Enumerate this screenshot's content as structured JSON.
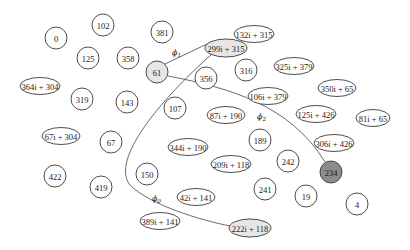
{
  "diagram": {
    "colors": {
      "default_fill": "#ffffff",
      "highlight_fill": "#e6e6e6",
      "active_fill": "#8c8c8c",
      "stroke": "#3a3a3a"
    },
    "nodes": [
      {
        "id": "n0",
        "label": "0",
        "shape": "circle",
        "cx": 56,
        "cy": 38,
        "rx": 11,
        "ry": 11,
        "fill": "default"
      },
      {
        "id": "n102",
        "label": "102",
        "shape": "circle",
        "cx": 103,
        "cy": 25,
        "rx": 11,
        "ry": 11,
        "fill": "default"
      },
      {
        "id": "n381",
        "label": "381",
        "shape": "circle",
        "cx": 162,
        "cy": 32,
        "rx": 11,
        "ry": 11,
        "fill": "default"
      },
      {
        "id": "n132i315",
        "label": "132i + 315",
        "shape": "ellipse",
        "cx": 254,
        "cy": 34,
        "rx": 20,
        "ry": 8.5,
        "fill": "default"
      },
      {
        "id": "n299i315",
        "label": "299i + 315",
        "shape": "ellipse",
        "cx": 226,
        "cy": 48,
        "rx": 21,
        "ry": 9,
        "fill": "highlight"
      },
      {
        "id": "n125",
        "label": "125",
        "shape": "circle",
        "cx": 88,
        "cy": 58,
        "rx": 11,
        "ry": 11,
        "fill": "default"
      },
      {
        "id": "n358",
        "label": "358",
        "shape": "circle",
        "cx": 128,
        "cy": 58,
        "rx": 11,
        "ry": 11,
        "fill": "default"
      },
      {
        "id": "n61",
        "label": "61",
        "shape": "circle",
        "cx": 157,
        "cy": 72,
        "rx": 11,
        "ry": 11,
        "fill": "highlight"
      },
      {
        "id": "n356",
        "label": "356",
        "shape": "circle",
        "cx": 206,
        "cy": 78,
        "rx": 11,
        "ry": 11,
        "fill": "default"
      },
      {
        "id": "n316",
        "label": "316",
        "shape": "circle",
        "cx": 246,
        "cy": 70,
        "rx": 11,
        "ry": 11,
        "fill": "default"
      },
      {
        "id": "n325i379",
        "label": "325i + 379",
        "shape": "ellipse",
        "cx": 294,
        "cy": 66,
        "rx": 20,
        "ry": 8.5,
        "fill": "default"
      },
      {
        "id": "n364i304",
        "label": "364i + 304",
        "shape": "ellipse",
        "cx": 40,
        "cy": 86,
        "rx": 20,
        "ry": 8.5,
        "fill": "default"
      },
      {
        "id": "n319",
        "label": "319",
        "shape": "circle",
        "cx": 82,
        "cy": 99,
        "rx": 11,
        "ry": 11,
        "fill": "default"
      },
      {
        "id": "n143",
        "label": "143",
        "shape": "circle",
        "cx": 127,
        "cy": 102,
        "rx": 11,
        "ry": 11,
        "fill": "default"
      },
      {
        "id": "n107",
        "label": "107",
        "shape": "circle",
        "cx": 175,
        "cy": 108,
        "rx": 11,
        "ry": 11,
        "fill": "default"
      },
      {
        "id": "n106i379",
        "label": "106i + 379",
        "shape": "ellipse",
        "cx": 268,
        "cy": 96,
        "rx": 20,
        "ry": 8.5,
        "fill": "default"
      },
      {
        "id": "n350i65",
        "label": "350i + 65",
        "shape": "ellipse",
        "cx": 337,
        "cy": 88,
        "rx": 19,
        "ry": 8.5,
        "fill": "default"
      },
      {
        "id": "n87i190",
        "label": "87i + 190",
        "shape": "ellipse",
        "cx": 226,
        "cy": 115,
        "rx": 19,
        "ry": 8.5,
        "fill": "default"
      },
      {
        "id": "n125i426",
        "label": "125i + 426",
        "shape": "ellipse",
        "cx": 316,
        "cy": 114,
        "rx": 20,
        "ry": 8.5,
        "fill": "default"
      },
      {
        "id": "n81i65",
        "label": "81i + 65",
        "shape": "ellipse",
        "cx": 373,
        "cy": 118,
        "rx": 17,
        "ry": 8.5,
        "fill": "default"
      },
      {
        "id": "n67i304",
        "label": "67i + 304",
        "shape": "ellipse",
        "cx": 61,
        "cy": 136,
        "rx": 19,
        "ry": 8.5,
        "fill": "default"
      },
      {
        "id": "n67",
        "label": "67",
        "shape": "circle",
        "cx": 111,
        "cy": 142,
        "rx": 11,
        "ry": 11,
        "fill": "default"
      },
      {
        "id": "n344i190",
        "label": "344i + 190",
        "shape": "ellipse",
        "cx": 188,
        "cy": 147,
        "rx": 20,
        "ry": 8.5,
        "fill": "default"
      },
      {
        "id": "n189",
        "label": "189",
        "shape": "circle",
        "cx": 260,
        "cy": 140,
        "rx": 11,
        "ry": 11,
        "fill": "default"
      },
      {
        "id": "n306i426",
        "label": "306i + 426",
        "shape": "ellipse",
        "cx": 334,
        "cy": 143,
        "rx": 20,
        "ry": 8.5,
        "fill": "default"
      },
      {
        "id": "n242",
        "label": "242",
        "shape": "circle",
        "cx": 288,
        "cy": 161,
        "rx": 11,
        "ry": 11,
        "fill": "default"
      },
      {
        "id": "n234",
        "label": "234",
        "shape": "circle",
        "cx": 331,
        "cy": 172,
        "rx": 11,
        "ry": 11,
        "fill": "active"
      },
      {
        "id": "n422",
        "label": "422",
        "shape": "circle",
        "cx": 55,
        "cy": 176,
        "rx": 11,
        "ry": 11,
        "fill": "default"
      },
      {
        "id": "n419",
        "label": "419",
        "shape": "circle",
        "cx": 101,
        "cy": 187,
        "rx": 11,
        "ry": 11,
        "fill": "default"
      },
      {
        "id": "n150",
        "label": "150",
        "shape": "circle",
        "cx": 147,
        "cy": 174,
        "rx": 11,
        "ry": 11,
        "fill": "default"
      },
      {
        "id": "n209i118",
        "label": "209i + 118",
        "shape": "ellipse",
        "cx": 231,
        "cy": 164,
        "rx": 20,
        "ry": 8.5,
        "fill": "default"
      },
      {
        "id": "n42i141",
        "label": "42i + 141",
        "shape": "ellipse",
        "cx": 196,
        "cy": 197,
        "rx": 19,
        "ry": 8.5,
        "fill": "default"
      },
      {
        "id": "n241",
        "label": "241",
        "shape": "circle",
        "cx": 265,
        "cy": 189,
        "rx": 11,
        "ry": 11,
        "fill": "default"
      },
      {
        "id": "n19",
        "label": "19",
        "shape": "circle",
        "cx": 306,
        "cy": 196,
        "rx": 11,
        "ry": 11,
        "fill": "default"
      },
      {
        "id": "n4",
        "label": "4",
        "shape": "circle",
        "cx": 357,
        "cy": 204,
        "rx": 11,
        "ry": 11,
        "fill": "default"
      },
      {
        "id": "n389i141",
        "label": "389i + 141",
        "shape": "ellipse",
        "cx": 160,
        "cy": 221,
        "rx": 20,
        "ry": 8.5,
        "fill": "default"
      },
      {
        "id": "n222i118",
        "label": "222i + 118",
        "shape": "ellipse",
        "cx": 250,
        "cy": 228,
        "rx": 21,
        "ry": 9,
        "fill": "highlight"
      }
    ],
    "edges": [
      {
        "id": "phi1",
        "from": "61",
        "to": "299i + 315",
        "path": "M 165 64 L 207 44"
      },
      {
        "id": "phi0",
        "from": "299i + 315",
        "to": "222i + 118",
        "path": "M 212 54 C 160 100, 110 160, 130 185 C 150 205, 200 220, 230 226"
      },
      {
        "id": "phi2",
        "from": "61",
        "to": "234",
        "path": "M 168 76 C 230 88, 290 105, 325 162"
      }
    ],
    "edge_labels": [
      {
        "id": "phi1-label",
        "base": "ϕ",
        "sub": "1",
        "x": 172,
        "y": 55
      },
      {
        "id": "phi2-label",
        "base": "ϕ",
        "sub": "2",
        "x": 257,
        "y": 119
      },
      {
        "id": "phi0-label",
        "base": "ϕ",
        "sub": "0",
        "x": 152,
        "y": 201
      }
    ]
  }
}
